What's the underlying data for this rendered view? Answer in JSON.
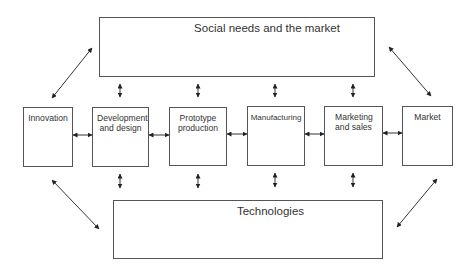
{
  "diagram": {
    "top_box": {
      "label": "Social needs and the market"
    },
    "bottom_box": {
      "label": "Technologies"
    },
    "stages": [
      {
        "label": "Innovation"
      },
      {
        "label": "Development and design"
      },
      {
        "label": "Prototype production"
      },
      {
        "label": "Manufacturing"
      },
      {
        "label": "Marketing and sales"
      },
      {
        "label": "Market"
      }
    ],
    "colors": {
      "border": "#555555",
      "text": "#333333",
      "arrow": "#222222"
    }
  }
}
